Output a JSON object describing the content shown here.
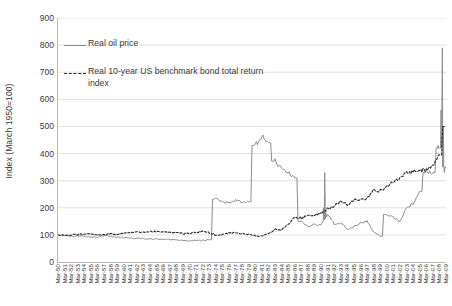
{
  "chart_data": {
    "type": "line",
    "title": "",
    "xlabel": "",
    "ylabel": "Index (March 1950=100)",
    "ylim": [
      0,
      900
    ],
    "ytick_step": 100,
    "yticks": [
      0,
      100,
      200,
      300,
      400,
      500,
      600,
      700,
      800,
      900
    ],
    "grid": "horizontal",
    "legend_position": "upper-left-inside",
    "colors": {
      "oil": "#8c8c8c",
      "bond": "#2b2b2b",
      "grid": "#d9d9d9",
      "axis": "#b9b9b9",
      "text": "#3a3a3a",
      "background": "#ffffff"
    },
    "x": [
      "Mar-50",
      "Mar-51",
      "Mar-52",
      "Mar-53",
      "Mar-54",
      "Mar-55",
      "Mar-56",
      "Mar-57",
      "Mar-58",
      "Mar-59",
      "Mar-60",
      "Mar-61",
      "Mar-62",
      "Mar-63",
      "Mar-64",
      "Mar-65",
      "Mar-66",
      "Mar-67",
      "Mar-68",
      "Mar-69",
      "Mar-70",
      "Mar-71",
      "Mar-72",
      "Mar-73",
      "Mar-74",
      "Mar-75",
      "Mar-76",
      "Mar-77",
      "Mar-78",
      "Mar-79",
      "Mar-80",
      "Mar-81",
      "Mar-82",
      "Mar-83",
      "Mar-84",
      "Mar-85",
      "Mar-86",
      "Mar-87",
      "Mar-88",
      "Mar-89",
      "Mar-90",
      "Mar-91",
      "Mar-92",
      "Mar-93",
      "Mar-94",
      "Mar-95",
      "Mar-96",
      "Mar-97",
      "Mar-98",
      "Mar-99",
      "Mar-00",
      "Mar-01",
      "Mar-02",
      "Mar-03",
      "Mar-04",
      "Mar-05",
      "Mar-06",
      "Mar-07",
      "Mar-08",
      "Mar-09"
    ],
    "xticks": [
      "Mar-50",
      "Mar-51",
      "Mar-52",
      "Mar-53",
      "Mar-54",
      "Mar-55",
      "Mar-56",
      "Mar-57",
      "Mar-58",
      "Mar-59",
      "Mar-60",
      "Mar-61",
      "Mar-62",
      "Mar-63",
      "Mar-64",
      "Mar-65",
      "Mar-66",
      "Mar-67",
      "Mar-68",
      "Mar-69",
      "Mar-70",
      "Mar-71",
      "Mar-72",
      "Mar-73",
      "Mar-74",
      "Mar-75",
      "Mar-76",
      "Mar-77",
      "Mar-78",
      "Mar-79",
      "Mar-80",
      "Mar-81",
      "Mar-82",
      "Mar-83",
      "Mar-84",
      "Mar-85",
      "Mar-86",
      "Mar-87",
      "Mar-88",
      "Mar-89",
      "Mar-90",
      "Mar-91",
      "Mar-92",
      "Mar-93",
      "Mar-94",
      "Mar-95",
      "Mar-96",
      "Mar-97",
      "Mar-98",
      "Mar-99",
      "Mar-00",
      "Mar-01",
      "Mar-02",
      "Mar-03",
      "Mar-04",
      "Mar-05",
      "Mar-06",
      "Mar-07",
      "Mar-08",
      "Mar-09"
    ],
    "series": [
      {
        "name": "Real oil price",
        "style": "solid",
        "color": "#8c8c8c",
        "values": [
          100,
          97,
          95,
          96,
          95,
          93,
          92,
          97,
          94,
          91,
          90,
          89,
          88,
          86,
          85,
          84,
          83,
          83,
          82,
          80,
          78,
          80,
          79,
          82,
          232,
          222,
          218,
          228,
          218,
          222,
          430,
          462,
          440,
          372,
          345,
          330,
          310,
          150,
          130,
          140,
          135,
          175,
          140,
          145,
          120,
          130,
          145,
          150,
          110,
          95,
          175,
          165,
          150,
          200,
          215,
          260,
          330,
          330,
          420,
          350
        ]
      },
      {
        "name": "Real 10-year US benchmark bond total return index",
        "style": "dashed",
        "color": "#2b2b2b",
        "values": [
          100,
          99,
          100,
          101,
          104,
          103,
          101,
          100,
          104,
          101,
          106,
          108,
          110,
          111,
          112,
          112,
          110,
          109,
          108,
          104,
          105,
          110,
          112,
          109,
          100,
          100,
          107,
          108,
          104,
          102,
          96,
          95,
          105,
          120,
          118,
          140,
          165,
          162,
          170,
          175,
          180,
          195,
          205,
          225,
          210,
          230,
          228,
          235,
          265,
          262,
          275,
          300,
          310,
          330,
          335,
          340,
          340,
          355,
          395,
          500
        ]
      }
    ],
    "annotations": {
      "peak_oil_2008": 790,
      "peak_oil_1980": 462,
      "trough_oil_1998": 95
    }
  },
  "legend": {
    "items": [
      {
        "label": "Real oil price",
        "swatch": "solid-line-swatch"
      },
      {
        "label": "Real 10-year US benchmark bond total return index",
        "swatch": "dashed-line-swatch"
      }
    ]
  }
}
